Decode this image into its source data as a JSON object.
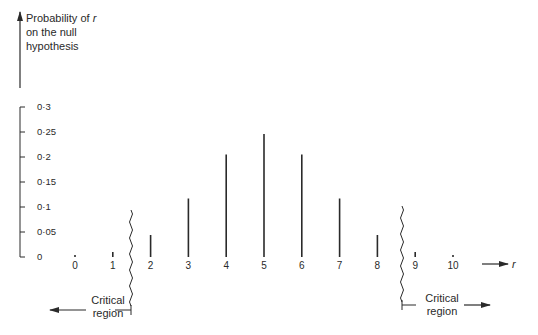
{
  "chart_data": {
    "type": "bar",
    "title": "",
    "xlabel": "r",
    "ylabel": "Probability of r on the null hypothesis",
    "ylabel_lines": [
      "Probability of ",
      "on the null",
      "hypothesis"
    ],
    "ylabel_var": "r",
    "categories": [
      "0",
      "1",
      "2",
      "3",
      "4",
      "5",
      "6",
      "7",
      "8",
      "9",
      "10"
    ],
    "values": [
      0.001,
      0.0098,
      0.044,
      0.117,
      0.205,
      0.246,
      0.205,
      0.117,
      0.044,
      0.0098,
      0.001
    ],
    "yticks": [
      "0",
      "0·05",
      "0·1",
      "0·15",
      "0·2",
      "0·25",
      "0·3"
    ],
    "ytick_values": [
      0,
      0.05,
      0.1,
      0.15,
      0.2,
      0.25,
      0.3
    ],
    "ylim": [
      0,
      0.3
    ],
    "grid": false,
    "annotations": [
      {
        "text_lines": [
          "Critical",
          "region"
        ],
        "direction": "left",
        "boundary_between": [
          "1",
          "2"
        ]
      },
      {
        "text_lines": [
          "Critical",
          "region"
        ],
        "direction": "right",
        "boundary_between": [
          "8",
          "9"
        ]
      }
    ]
  },
  "colors": {
    "ink": "#2a2a2a",
    "background": "#ffffff"
  }
}
